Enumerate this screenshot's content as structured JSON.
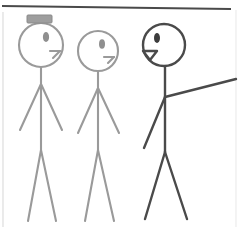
{
  "canvas": {
    "width": 238,
    "height": 227,
    "background_color": "#ffffff",
    "description": "Hand-drawn style line art of three stick figures standing side by side"
  },
  "palette": {
    "gray_stroke": "#9a9a9a",
    "dark_stroke": "#4a4a4a",
    "hat_fill": "#9e9e9e",
    "hat_stroke": "#8a8a8a",
    "eye_fill": "#8f8f8f",
    "eye_fill_dark": "#3d3d3d",
    "border_line": "#4a4a4a",
    "edge_line": "#dcdcdc",
    "background": "#ffffff"
  },
  "borders": {
    "top_rule": {
      "label": "top-horizontal-rule",
      "x1": 2,
      "y1": 6,
      "x2": 231,
      "y2": 9,
      "color": "#4a4a4a",
      "width": 2.2
    },
    "left_rule": {
      "label": "left-vertical-edge",
      "x1": 3,
      "y1": 12,
      "x2": 3,
      "y2": 227,
      "color": "#e2e2e2",
      "width": 1.4
    },
    "right_rule": {
      "label": "right-vertical-edge",
      "x1": 236,
      "y1": 10,
      "x2": 236,
      "y2": 227,
      "color": "#ececec",
      "width": 1.2
    }
  },
  "figures": [
    {
      "id": "figure-left",
      "name": "stick-figure-with-hat",
      "stroke_color": "#9a9a9a",
      "stroke_width": 2.1,
      "has_hat": true,
      "mouth_style": "line",
      "head": {
        "cx": 41,
        "cy": 45,
        "rx": 22,
        "ry": 22
      },
      "hat": {
        "x": 27,
        "y": 15,
        "width": 25,
        "height": 8,
        "rx": 1
      },
      "eye": {
        "cx": 46,
        "cy": 37,
        "rx": 3.1,
        "ry": 5.0,
        "fill": "#8f8f8f"
      },
      "nose": {
        "x1": 50,
        "y1": 51,
        "x2": 60,
        "y2": 51
      },
      "mouth": {
        "x1": 60,
        "y1": 51,
        "x2": 53,
        "y2": 58
      },
      "spine": {
        "x1": 41,
        "y1": 67,
        "x2": 41,
        "y2": 150
      },
      "arm_left": {
        "x1": 41,
        "y1": 84,
        "x2": 20,
        "y2": 130
      },
      "arm_right": {
        "x1": 41,
        "y1": 84,
        "x2": 62,
        "y2": 130
      },
      "leg_left": {
        "x1": 41,
        "y1": 150,
        "x2": 28,
        "y2": 221
      },
      "leg_right": {
        "x1": 41,
        "y1": 150,
        "x2": 56,
        "y2": 221
      }
    },
    {
      "id": "figure-middle",
      "name": "stick-figure-plain",
      "stroke_color": "#9a9a9a",
      "stroke_width": 2.1,
      "has_hat": false,
      "mouth_style": "line",
      "head": {
        "cx": 98,
        "cy": 51,
        "rx": 20,
        "ry": 20
      },
      "hat": null,
      "eye": {
        "cx": 102,
        "cy": 44,
        "rx": 3.0,
        "ry": 4.8,
        "fill": "#8f8f8f"
      },
      "nose": {
        "x1": 104,
        "y1": 57,
        "x2": 114,
        "y2": 57
      },
      "mouth": {
        "x1": 114,
        "y1": 57,
        "x2": 108,
        "y2": 63
      },
      "spine": {
        "x1": 98,
        "y1": 71,
        "x2": 98,
        "y2": 150
      },
      "arm_left": {
        "x1": 98,
        "y1": 88,
        "x2": 78,
        "y2": 133
      },
      "arm_right": {
        "x1": 98,
        "y1": 88,
        "x2": 119,
        "y2": 133
      },
      "leg_left": {
        "x1": 98,
        "y1": 150,
        "x2": 85,
        "y2": 221
      },
      "leg_right": {
        "x1": 98,
        "y1": 150,
        "x2": 114,
        "y2": 221
      }
    },
    {
      "id": "figure-right",
      "name": "stick-figure-pointing",
      "stroke_color": "#4a4a4a",
      "stroke_width": 2.4,
      "has_hat": false,
      "mouth_style": "open-triangle",
      "head": {
        "cx": 164,
        "cy": 45,
        "rx": 21,
        "ry": 21
      },
      "hat": null,
      "eye": {
        "cx": 157,
        "cy": 38,
        "rx": 3.0,
        "ry": 5.0,
        "fill": "#3d3d3d"
      },
      "nose": {
        "x1": 143,
        "y1": 51,
        "x2": 157,
        "y2": 51
      },
      "mouth": {
        "points": "143,51 157,51 150,60"
      },
      "spine": {
        "x1": 165,
        "y1": 66,
        "x2": 165,
        "y2": 152
      },
      "arm_left": {
        "x1": 165,
        "y1": 97,
        "x2": 144,
        "y2": 148
      },
      "arm_right": {
        "x1": 165,
        "y1": 97,
        "x2": 236,
        "y2": 79
      },
      "leg_left": {
        "x1": 165,
        "y1": 152,
        "x2": 145,
        "y2": 219
      },
      "leg_right": {
        "x1": 165,
        "y1": 152,
        "x2": 187,
        "y2": 219
      }
    }
  ]
}
